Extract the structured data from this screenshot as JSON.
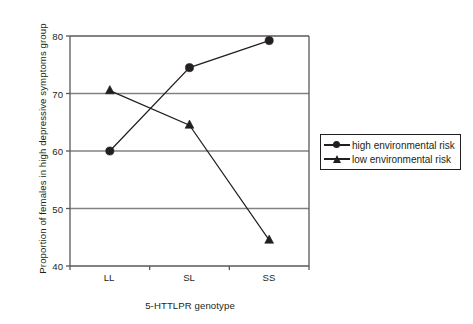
{
  "chart_data": {
    "type": "line",
    "title": "",
    "xlabel": "5-HTTLPR genotype",
    "ylabel": "Proportion of females in high depressive symptoms group",
    "categories": [
      "LL",
      "SL",
      "SS"
    ],
    "ylim": [
      40,
      80
    ],
    "yticks": [
      40,
      50,
      60,
      70,
      80
    ],
    "ytick_labels": [
      "40",
      "50",
      "60",
      "70",
      "80"
    ],
    "grid": "horizontal",
    "legend_position": "right",
    "series": [
      {
        "name": "high environmental risk",
        "marker": "circle",
        "color": "#231f20",
        "values": [
          60.0,
          74.5,
          79.2
        ]
      },
      {
        "name": "low environmental risk",
        "marker": "triangle",
        "color": "#231f20",
        "values": [
          70.5,
          64.5,
          44.5
        ]
      }
    ]
  },
  "legend": {
    "items": [
      {
        "label": "high environmental risk",
        "marker": "circle-marker-icon"
      },
      {
        "label": "low environmental risk",
        "marker": "triangle-marker-icon"
      }
    ]
  },
  "axes": {
    "y_tick_0": "40",
    "y_tick_1": "50",
    "y_tick_2": "60",
    "y_tick_3": "70",
    "y_tick_4": "80",
    "x_tick_0": "LL",
    "x_tick_1": "SL",
    "x_tick_2": "SS",
    "x_title": "5-HTTLPR genotype",
    "y_title": "Proportion of females in high depressive symptoms group"
  }
}
